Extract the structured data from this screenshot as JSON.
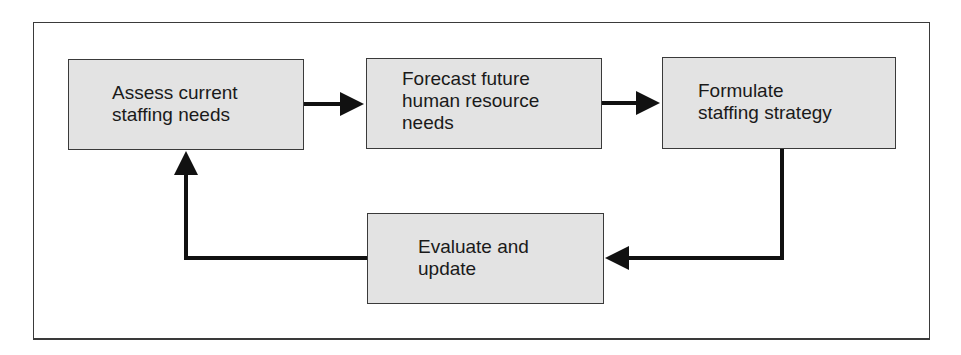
{
  "diagram": {
    "type": "process-cycle",
    "nodes": [
      {
        "id": "assess",
        "label": "Assess current\nstaffing needs"
      },
      {
        "id": "forecast",
        "label": "Forecast future\nhuman resource\nneeds"
      },
      {
        "id": "formulate",
        "label": "Formulate\nstaffing strategy"
      },
      {
        "id": "evaluate",
        "label": "Evaluate and\nupdate"
      }
    ],
    "edges": [
      {
        "from": "assess",
        "to": "forecast"
      },
      {
        "from": "forecast",
        "to": "formulate"
      },
      {
        "from": "formulate",
        "to": "evaluate"
      },
      {
        "from": "evaluate",
        "to": "assess"
      }
    ],
    "colors": {
      "box_fill": "#e3e3e3",
      "box_border": "#3a3a3a",
      "arrow": "#111111",
      "text": "#1a1a1a"
    }
  }
}
